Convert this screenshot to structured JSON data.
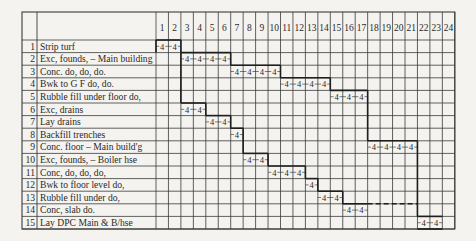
{
  "chart_data": {
    "type": "table",
    "columns": [
      "1",
      "2",
      "3",
      "4",
      "5",
      "6",
      "7",
      "8",
      "9",
      "10",
      "11",
      "12",
      "13",
      "14",
      "15",
      "16",
      "17",
      "18",
      "19",
      "20",
      "21",
      "22",
      "23",
      "24"
    ],
    "rows": [
      {
        "no": "1",
        "activity": "Strip turf",
        "start": 1,
        "end": 2,
        "duration_labels": [
          "4",
          "4"
        ]
      },
      {
        "no": "2",
        "activity": "Exc, founds, – Main building",
        "start": 3,
        "end": 6,
        "duration_labels": [
          "4",
          "4",
          "4",
          "4"
        ]
      },
      {
        "no": "3",
        "activity": "Conc.        do,  do,  do.",
        "start": 7,
        "end": 10,
        "duration_labels": [
          "4",
          "4",
          "4",
          "4"
        ]
      },
      {
        "no": "4",
        "activity": "Bwk to G F        do,  do.",
        "start": 11,
        "end": 14,
        "duration_labels": [
          "4",
          "4",
          "4",
          "4"
        ]
      },
      {
        "no": "5",
        "activity": "Rubble fill under floor  do,",
        "start": 15,
        "end": 17,
        "duration_labels": [
          "4",
          "4",
          "4"
        ]
      },
      {
        "no": "6",
        "activity": "Exc, drains",
        "start": 3,
        "end": 4,
        "duration_labels": [
          "4",
          "4"
        ]
      },
      {
        "no": "7",
        "activity": "Lay drains",
        "start": 5,
        "end": 6,
        "duration_labels": [
          "4",
          "4"
        ]
      },
      {
        "no": "8",
        "activity": "Backfill trenches",
        "start": 7,
        "end": 7,
        "duration_labels": [
          "4"
        ]
      },
      {
        "no": "9",
        "activity": "Conc. floor – Main build'g",
        "start": 18,
        "end": 21,
        "duration_labels": [
          "4",
          "4",
          "4",
          "4"
        ]
      },
      {
        "no": "10",
        "activity": "Exc, founds, – Boiler hse",
        "start": 8,
        "end": 9,
        "duration_labels": [
          "4",
          "4"
        ]
      },
      {
        "no": "11",
        "activity": "Conc,         do,  do,  do,",
        "start": 10,
        "end": 12,
        "duration_labels": [
          "4",
          "4",
          "4"
        ]
      },
      {
        "no": "12",
        "activity": "Bwk to floor level      do,",
        "start": 13,
        "end": 13,
        "duration_labels": [
          "4"
        ]
      },
      {
        "no": "13",
        "activity": "Rubble fill under       do,",
        "start": 14,
        "end": 15,
        "duration_labels": [
          "4",
          "4"
        ]
      },
      {
        "no": "14",
        "activity": "Conc, slab               do.",
        "start": 16,
        "end": 17,
        "duration_labels": [
          "4",
          "4"
        ],
        "float_end": 21
      },
      {
        "no": "15",
        "activity": "Lay DPC Main & B/hse",
        "start": 22,
        "end": 23,
        "duration_labels": [
          "4",
          "4"
        ]
      }
    ]
  },
  "colors": {
    "background": "#f4f3ef",
    "grid": "#3a3a3a",
    "thick_line": "#1e1e1e",
    "text": "#2a2a2a"
  }
}
